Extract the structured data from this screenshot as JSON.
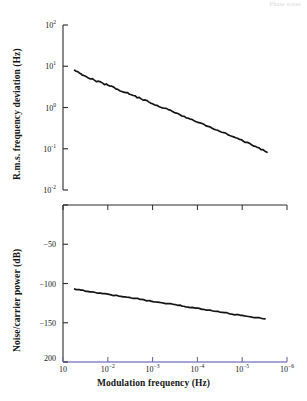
{
  "header": {
    "faint_note": "Phase noise"
  },
  "chart_data": [
    {
      "type": "line",
      "panel": "top",
      "title": "",
      "xlabel": "Modulation frequency (Hz)",
      "ylabel": "R.m.s. frequency deviation (Hz)",
      "xscale": "log",
      "yscale": "log",
      "xlim": [
        0.1,
        1e-06
      ],
      "ylim": [
        0.01,
        100
      ],
      "x_reversed": true,
      "grid": false,
      "legend": "none",
      "xticks": [
        "10",
        "10-2",
        "10-3",
        "10-4",
        "10-5",
        "10-6"
      ],
      "xtick_labels": [
        "10",
        "10⁻²",
        "10⁻³",
        "10⁻⁴",
        "10⁻⁵",
        "10⁻⁶"
      ],
      "yticks": [
        0.01,
        0.1,
        1,
        10,
        100
      ],
      "ytick_labels": [
        "10⁻²",
        "10⁻¹",
        "10⁰",
        "10¹",
        "10²"
      ],
      "series": [
        {
          "name": "rms frequency deviation",
          "color": "#141414",
          "x": [
            0.055,
            0.04,
            0.03,
            0.02,
            0.013,
            0.009,
            0.006,
            0.004,
            0.0027,
            0.0018,
            0.0012,
            0.0008,
            0.00055,
            0.00036,
            0.00024,
            0.00016,
            0.00011,
            7e-05,
            4.8e-05,
            3.2e-05,
            2.1e-05,
            1.4e-05,
            9.4e-06,
            6.3e-06,
            4.2e-06,
            2.8e-06
          ],
          "y": [
            8.0,
            6.6,
            5.6,
            4.6,
            3.9,
            3.3,
            2.75,
            2.3,
            1.95,
            1.62,
            1.35,
            1.13,
            0.96,
            0.8,
            0.66,
            0.55,
            0.46,
            0.385,
            0.32,
            0.265,
            0.22,
            0.185,
            0.152,
            0.127,
            0.105,
            0.082
          ]
        }
      ]
    },
    {
      "type": "line",
      "panel": "bottom",
      "title": "",
      "xlabel": "Modulation frequency (Hz)",
      "ylabel": "Noise/carrier power (dB)",
      "xscale": "log",
      "yscale": "linear",
      "xlim": [
        0.1,
        1e-06
      ],
      "ylim": [
        -200,
        0
      ],
      "x_reversed": true,
      "grid": false,
      "legend": "none",
      "xticks": [
        "10",
        "10-2",
        "10-3",
        "10-4",
        "10-5",
        "10-6"
      ],
      "xtick_labels": [
        "10",
        "10⁻²",
        "10⁻³",
        "10⁻⁴",
        "10⁻⁵",
        "10⁻⁶"
      ],
      "yticks": [
        0,
        -50,
        -100,
        -150,
        -200
      ],
      "ytick_labels": [
        "",
        "-50",
        "-100",
        "-150",
        "200"
      ],
      "series": [
        {
          "name": "noise/carrier power",
          "color": "#141414",
          "x": [
            0.055,
            0.04,
            0.028,
            0.019,
            0.013,
            0.0085,
            0.0056,
            0.0037,
            0.0024,
            0.0016,
            0.0011,
            0.0007,
            0.00046,
            0.0003,
            0.0002,
            0.00013,
            8.8e-05,
            5.8e-05,
            3.8e-05,
            2.5e-05,
            1.7e-05,
            1.1e-05,
            7.2e-06,
            4.7e-06,
            3.1e-06
          ],
          "y": [
            -107.0,
            -108.5,
            -110.0,
            -111.5,
            -113.0,
            -114.5,
            -116.0,
            -117.5,
            -119.0,
            -120.5,
            -122.5,
            -124.0,
            -125.5,
            -127.0,
            -129.0,
            -130.5,
            -132.0,
            -134.0,
            -135.5,
            -137.0,
            -139.0,
            -140.5,
            -142.0,
            -143.5,
            -145.0
          ]
        }
      ]
    }
  ],
  "axes": {
    "top_panel": {
      "y_tick_labels": [
        {
          "text": "10",
          "exp": "2",
          "value": 100
        },
        {
          "text": "10",
          "exp": "1",
          "value": 10
        },
        {
          "text": "10",
          "exp": "0",
          "value": 1
        },
        {
          "text": "10",
          "exp": "-1",
          "value": 0.1
        },
        {
          "text": "10",
          "exp": "-2",
          "value": 0.01
        }
      ]
    },
    "bottom_panel": {
      "y_tick_labels": [
        {
          "text": "-50"
        },
        {
          "text": "-100"
        },
        {
          "text": "-150"
        },
        {
          "text": "200"
        }
      ]
    },
    "x_tick_labels": [
      {
        "text": "10",
        "exp": ""
      },
      {
        "text": "10",
        "exp": "-2"
      },
      {
        "text": "10",
        "exp": "-3"
      },
      {
        "text": "10",
        "exp": "-4"
      },
      {
        "text": "10",
        "exp": "-5"
      },
      {
        "text": "10",
        "exp": "-6"
      }
    ]
  },
  "colors": {
    "curve": "#141414",
    "axis": "#2b2b2b",
    "baseline_tint": "#8a86c8",
    "text": "#161616"
  }
}
